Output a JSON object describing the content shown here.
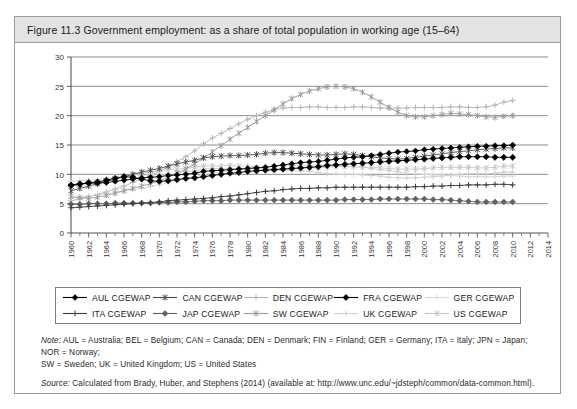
{
  "figure": {
    "title": "Figure 11.3  Government employment: as a share of total population in working age (15–64)",
    "note_label": "Note:",
    "note_text": "AUL = Australia; BEL = Belgium; CAN = Canada; DEN = Denmark; FIN = Finland; GER = Germany; ITA = Italy; JPN = Japan; NOR = Norway;",
    "note_text2": "SW = Sweden; UK = United Kingdom; US = United States",
    "source_label": "Source:",
    "source_text": "Calculated from Brady, Huber, and Stephens (2014) (available at:  http://www.unc.edu/~jdsteph/common/data-common.html)."
  },
  "colors": {
    "header_bg": "#e3e3e3",
    "border": "#9a9a9a",
    "axis": "#555555",
    "gridline": "#6e6e6e",
    "aul": "#000000",
    "can": "#4a4a4a",
    "den": "#b4b4b4",
    "fra": "#000000",
    "ger": "#d8d8d8",
    "ita": "#3c3c3c",
    "jap": "#606060",
    "sw": "#9a9a9a",
    "uk": "#d0d0d0",
    "us": "#c4c4c4"
  },
  "chart_data": {
    "type": "line",
    "title": "Government employment: as a share of total population in working age (15–64)",
    "xlabel": "",
    "ylabel": "",
    "xlim": [
      1960,
      2014
    ],
    "ylim": [
      0,
      30
    ],
    "yticks": [
      0,
      5,
      10,
      15,
      20,
      25,
      30
    ],
    "grid": true,
    "legend_position": "below",
    "xticks": [
      1960,
      1962,
      1964,
      1966,
      1968,
      1970,
      1972,
      1974,
      1976,
      1978,
      1980,
      1982,
      1984,
      1986,
      1988,
      1990,
      1992,
      1994,
      1996,
      1998,
      2000,
      2002,
      2004,
      2006,
      2008,
      2010,
      2012,
      2014
    ],
    "minor_tick_interval": 1,
    "x": [
      1960,
      1961,
      1962,
      1963,
      1964,
      1965,
      1966,
      1967,
      1968,
      1969,
      1970,
      1971,
      1972,
      1973,
      1974,
      1975,
      1976,
      1977,
      1978,
      1979,
      1980,
      1981,
      1982,
      1983,
      1984,
      1985,
      1986,
      1987,
      1988,
      1989,
      1990,
      1991,
      1992,
      1993,
      1994,
      1995,
      1996,
      1997,
      1998,
      1999,
      2000,
      2001,
      2002,
      2003,
      2004,
      2005,
      2006,
      2007,
      2008,
      2009,
      2010
    ],
    "series": [
      {
        "name": "AUL CGEWAP",
        "label": "AUL  CGEWAP",
        "marker": "diamond-filled",
        "color": "#000000",
        "values": [
          8.2,
          8.4,
          8.5,
          8.5,
          8.6,
          8.8,
          9.0,
          9.2,
          9.4,
          9.5,
          9.6,
          9.8,
          9.9,
          10.0,
          10.2,
          10.5,
          10.6,
          10.7,
          10.8,
          10.9,
          11.0,
          11.1,
          11.2,
          11.4,
          11.6,
          11.8,
          12.0,
          12.1,
          12.2,
          12.4,
          12.6,
          12.8,
          12.9,
          13.0,
          13.2,
          13.4,
          13.6,
          13.8,
          13.9,
          14.0,
          14.2,
          14.3,
          14.4,
          14.5,
          14.6,
          14.7,
          14.8,
          14.8,
          14.9,
          14.9,
          15.0
        ]
      },
      {
        "name": "CAN CGEWAP",
        "label": "CAN CGEWAP",
        "marker": "asterisk",
        "color": "#4a4a4a",
        "values": [
          7.2,
          7.6,
          8.0,
          8.4,
          8.8,
          9.2,
          9.6,
          10.0,
          10.4,
          10.7,
          11.0,
          11.4,
          11.8,
          12.1,
          12.4,
          12.8,
          13.0,
          13.1,
          13.2,
          13.2,
          13.3,
          13.4,
          13.6,
          13.7,
          13.7,
          13.6,
          13.5,
          13.4,
          13.3,
          13.3,
          13.4,
          13.5,
          13.4,
          13.2,
          13.0,
          12.8,
          12.7,
          12.6,
          12.7,
          12.9,
          13.1,
          13.3,
          13.5,
          13.7,
          13.9,
          14.0,
          14.2,
          14.3,
          14.4,
          14.5,
          14.5
        ]
      },
      {
        "name": "DEN CGEWAP",
        "label": "DEN CGEWAP",
        "marker": "plus",
        "color": "#b4b4b4",
        "values": [
          5.5,
          5.8,
          6.2,
          6.6,
          7.0,
          7.5,
          8.0,
          8.6,
          9.2,
          9.8,
          10.5,
          11.3,
          12.2,
          13.0,
          14.0,
          15.2,
          16.2,
          17.0,
          17.8,
          18.6,
          19.4,
          20.0,
          20.6,
          21.0,
          21.3,
          21.4,
          21.4,
          21.5,
          21.5,
          21.4,
          21.4,
          21.4,
          21.5,
          21.5,
          21.4,
          21.3,
          21.3,
          21.3,
          21.3,
          21.4,
          21.4,
          21.4,
          21.4,
          21.5,
          21.5,
          21.4,
          21.4,
          21.5,
          21.8,
          22.3,
          22.6
        ]
      },
      {
        "name": "FRA CGEWAP",
        "label": "FRA CGEWAP",
        "marker": "diamond-filled-bold",
        "color": "#000000",
        "values": [
          8.1,
          8.3,
          8.6,
          8.7,
          9.0,
          9.3,
          9.6,
          9.5,
          9.2,
          8.9,
          8.8,
          8.9,
          9.1,
          9.3,
          9.4,
          9.6,
          9.8,
          10.0,
          10.2,
          10.3,
          10.5,
          10.6,
          10.7,
          10.8,
          10.9,
          11.0,
          11.1,
          11.2,
          11.3,
          11.5,
          11.6,
          11.7,
          11.8,
          11.9,
          12.0,
          12.1,
          12.2,
          12.3,
          12.4,
          12.5,
          12.6,
          12.7,
          12.8,
          12.9,
          13.0,
          13.0,
          13.0,
          13.0,
          12.9,
          12.9,
          12.9
        ]
      },
      {
        "name": "GER CGEWAP",
        "label": "GER CGEWAP",
        "marker": "plus-light",
        "color": "#d8d8d8",
        "values": [
          6.0,
          6.1,
          6.3,
          6.5,
          6.7,
          6.9,
          7.2,
          7.4,
          7.6,
          7.9,
          8.2,
          8.6,
          8.9,
          9.3,
          9.6,
          10.0,
          10.2,
          10.4,
          10.6,
          10.8,
          11.0,
          11.2,
          11.3,
          11.4,
          11.4,
          11.5,
          11.5,
          11.6,
          11.6,
          11.6,
          11.5,
          11.4,
          11.3,
          11.2,
          11.0,
          10.8,
          10.6,
          10.4,
          10.2,
          10.1,
          10.0,
          9.9,
          9.9,
          9.8,
          9.7,
          9.6,
          9.6,
          9.6,
          9.6,
          9.7,
          9.7
        ]
      },
      {
        "name": "ITA CGEWAP",
        "label": "ITA CGEWAP",
        "marker": "plus-dark",
        "color": "#3c3c3c",
        "values": [
          4.3,
          4.4,
          4.5,
          4.6,
          4.7,
          4.8,
          4.9,
          5.0,
          5.1,
          5.2,
          5.3,
          5.5,
          5.6,
          5.7,
          5.8,
          5.9,
          6.0,
          6.2,
          6.3,
          6.5,
          6.7,
          6.9,
          7.1,
          7.2,
          7.4,
          7.5,
          7.6,
          7.6,
          7.7,
          7.7,
          7.8,
          7.8,
          7.8,
          7.8,
          7.8,
          7.8,
          7.8,
          7.8,
          7.8,
          7.9,
          7.9,
          8.0,
          8.0,
          8.1,
          8.1,
          8.2,
          8.2,
          8.2,
          8.3,
          8.3,
          8.2
        ]
      },
      {
        "name": "JAP CGEWAP",
        "label": "JAP CGEWAP",
        "marker": "diamond-gray",
        "color": "#606060",
        "values": [
          4.9,
          4.9,
          5.0,
          5.0,
          5.0,
          5.1,
          5.1,
          5.1,
          5.1,
          5.1,
          5.2,
          5.2,
          5.3,
          5.3,
          5.4,
          5.5,
          5.5,
          5.5,
          5.6,
          5.6,
          5.6,
          5.6,
          5.6,
          5.6,
          5.6,
          5.6,
          5.6,
          5.6,
          5.6,
          5.6,
          5.6,
          5.7,
          5.7,
          5.7,
          5.7,
          5.8,
          5.8,
          5.8,
          5.8,
          5.8,
          5.8,
          5.7,
          5.7,
          5.6,
          5.5,
          5.4,
          5.3,
          5.3,
          5.3,
          5.3,
          5.3
        ]
      },
      {
        "name": "SW CGEWAP",
        "label": "SW CGEWAP",
        "marker": "asterisk-gray",
        "color": "#9a9a9a",
        "values": [
          6.2,
          6.0,
          5.9,
          6.1,
          6.4,
          6.8,
          7.2,
          7.6,
          8.0,
          8.4,
          8.9,
          9.5,
          10.2,
          10.9,
          11.8,
          12.8,
          13.8,
          14.9,
          16.0,
          17.0,
          18.0,
          19.0,
          20.0,
          21.0,
          22.0,
          22.9,
          23.6,
          24.2,
          24.6,
          24.9,
          25.0,
          24.9,
          24.6,
          24.0,
          23.2,
          22.3,
          21.4,
          20.6,
          20.0,
          19.8,
          19.8,
          20.0,
          20.2,
          20.4,
          20.3,
          20.2,
          20.0,
          19.8,
          19.7,
          19.9,
          20.0
        ]
      },
      {
        "name": "UK CGEWAP",
        "label": "UK CGEWAP",
        "marker": "plus-vlight",
        "color": "#d0d0d0",
        "values": [
          8.8,
          8.9,
          9.0,
          9.1,
          9.3,
          9.5,
          9.7,
          9.9,
          9.9,
          9.9,
          9.9,
          10.0,
          10.2,
          10.4,
          10.6,
          10.9,
          11.0,
          11.0,
          11.0,
          11.0,
          11.0,
          10.9,
          10.8,
          10.7,
          10.7,
          10.6,
          10.6,
          10.5,
          10.3,
          10.1,
          10.0,
          10.0,
          10.0,
          9.9,
          9.8,
          9.7,
          9.5,
          9.4,
          9.4,
          9.4,
          9.5,
          9.6,
          9.7,
          9.9,
          10.0,
          10.1,
          10.1,
          10.1,
          10.2,
          10.4,
          10.4
        ]
      },
      {
        "name": "US CGEWAP",
        "label": "US CGEWAP",
        "marker": "asterisk-light",
        "color": "#c4c4c4",
        "values": [
          8.0,
          8.2,
          8.4,
          8.6,
          8.9,
          9.2,
          9.6,
          9.9,
          10.2,
          10.4,
          10.6,
          10.8,
          10.9,
          11.0,
          11.2,
          11.4,
          11.4,
          11.4,
          11.5,
          11.4,
          11.4,
          11.2,
          11.0,
          10.9,
          10.9,
          11.0,
          11.0,
          11.1,
          11.1,
          11.2,
          11.3,
          11.3,
          11.3,
          11.2,
          11.2,
          11.1,
          11.0,
          10.9,
          10.9,
          10.9,
          11.0,
          11.1,
          11.2,
          11.2,
          11.2,
          11.2,
          11.1,
          11.1,
          11.2,
          11.4,
          11.4
        ]
      }
    ]
  },
  "legend": {
    "rows": [
      [
        {
          "label": "AUL  CGEWAP",
          "marker": "diamond-filled",
          "color": "#000000"
        },
        {
          "label": "CAN CGEWAP",
          "marker": "asterisk",
          "color": "#4a4a4a"
        },
        {
          "label": "DEN CGEWAP",
          "marker": "plus",
          "color": "#b4b4b4"
        },
        {
          "label": "FRA CGEWAP",
          "marker": "diamond-filled-bold",
          "color": "#000000"
        },
        {
          "label": "GER CGEWAP",
          "marker": "plus-light",
          "color": "#d8d8d8"
        }
      ],
      [
        {
          "label": "ITA CGEWAP",
          "marker": "plus-dark",
          "color": "#3c3c3c"
        },
        {
          "label": "JAP CGEWAP",
          "marker": "diamond-gray",
          "color": "#606060"
        },
        {
          "label": "SW CGEWAP",
          "marker": "asterisk-gray",
          "color": "#9a9a9a"
        },
        {
          "label": "UK CGEWAP",
          "marker": "plus-vlight",
          "color": "#d0d0d0"
        },
        {
          "label": "US CGEWAP",
          "marker": "asterisk-light",
          "color": "#c4c4c4"
        }
      ]
    ]
  }
}
